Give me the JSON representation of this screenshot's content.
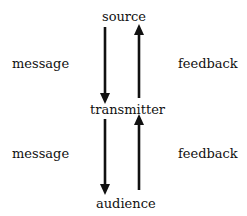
{
  "diagram": {
    "nodes": [
      {
        "id": "source",
        "label": "source"
      },
      {
        "id": "transmitter",
        "label": "transmitter"
      },
      {
        "id": "audience",
        "label": "audience"
      }
    ],
    "edges": [
      {
        "from": "source",
        "to": "transmitter",
        "label": "message"
      },
      {
        "from": "transmitter",
        "to": "source",
        "label": "feedback"
      },
      {
        "from": "transmitter",
        "to": "audience",
        "label": "message"
      },
      {
        "from": "audience",
        "to": "transmitter",
        "label": "feedback"
      }
    ],
    "labels": {
      "source": "source",
      "transmitter": "transmitter",
      "audience": "audience",
      "message_top": "message",
      "feedback_top": "feedback",
      "message_bottom": "message",
      "feedback_bottom": "feedback"
    },
    "colors": {
      "arrow": "#111111",
      "text": "#111111",
      "background": "#ffffff"
    }
  }
}
